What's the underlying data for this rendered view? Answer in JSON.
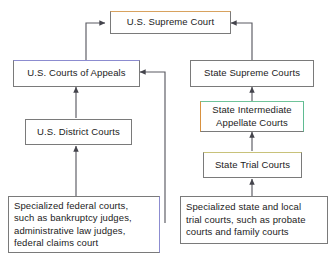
{
  "diagram": {
    "nodes": [
      {
        "id": "us-supreme-court",
        "label": "U.S. Supreme Court"
      },
      {
        "id": "us-courts-of-appeals",
        "label": "U.S. Courts of Appeals"
      },
      {
        "id": "state-supreme-courts",
        "label": "State Supreme Courts"
      },
      {
        "id": "us-district-courts",
        "label": "U.S. District Courts"
      },
      {
        "id": "state-intermediate-appellate-courts",
        "label": "State Intermediate\nAppellate Courts"
      },
      {
        "id": "state-trial-courts",
        "label": "State Trial Courts"
      },
      {
        "id": "specialized-federal-courts",
        "label": "Specialized federal courts,\nsuch as bankruptcy judges,\nadministrative law judges,\nfederal claims court"
      },
      {
        "id": "specialized-state-local-trial-courts",
        "label": "Specialized state and local\ntrial courts, such as probate\ncourts and family courts"
      }
    ],
    "edges": [
      {
        "from": "us-courts-of-appeals",
        "to": "us-supreme-court"
      },
      {
        "from": "state-supreme-courts",
        "to": "us-supreme-court"
      },
      {
        "from": "us-district-courts",
        "to": "us-courts-of-appeals"
      },
      {
        "from": "specialized-federal-courts",
        "to": "us-district-courts"
      },
      {
        "from": "specialized-federal-courts",
        "to": "us-courts-of-appeals"
      },
      {
        "from": "state-intermediate-appellate-courts",
        "to": "state-supreme-courts"
      },
      {
        "from": "state-trial-courts",
        "to": "state-intermediate-appellate-courts"
      },
      {
        "from": "specialized-state-local-trial-courts",
        "to": "state-trial-courts"
      }
    ],
    "colors": {
      "line": "#5a5a62",
      "box_border": "#7a7a7a",
      "text": "#1b1b1b",
      "background": "#ffffff",
      "accent_orange": "#d8a25f",
      "accent_blue": "#8c8cd0",
      "accent_green": "#6fc39a",
      "accent_olive": "#c8c27a"
    }
  }
}
